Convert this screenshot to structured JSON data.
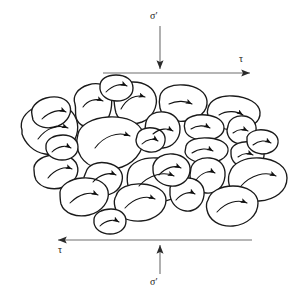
{
  "figure": {
    "background_color": "#ffffff",
    "stroke_color": "#1a1a1a",
    "arrow_line_color": "#6e6e6e",
    "width": 301,
    "height": 304
  },
  "labels": {
    "sigma_top": "σ′",
    "sigma_bottom": "σ′",
    "tau_top": "τ",
    "tau_bottom": "τ"
  },
  "chart_data": {
    "type": "diagram",
    "stress_indicators": [
      {
        "name": "normal-effective-stress-top",
        "symbol": "σ′",
        "direction": "down",
        "arrow": {
          "x1": 160,
          "y1": 26,
          "x2": 160,
          "y2": 68
        },
        "label_position": {
          "x": 150,
          "y": 11
        }
      },
      {
        "name": "shear-stress-top",
        "symbol": "τ",
        "direction": "right",
        "arrow": {
          "x1": 103,
          "y1": 73,
          "x2": 251,
          "y2": 73
        },
        "label_position": {
          "x": 239,
          "y": 54
        }
      },
      {
        "name": "shear-stress-bottom",
        "symbol": "τ",
        "direction": "left",
        "arrow": {
          "x1": 252,
          "y1": 240,
          "x2": 57,
          "y2": 240
        },
        "label_position": {
          "x": 58,
          "y": 245
        }
      },
      {
        "name": "normal-effective-stress-bottom",
        "symbol": "σ′",
        "direction": "up",
        "arrow": {
          "x1": 160,
          "y1": 274,
          "x2": 160,
          "y2": 245
        },
        "label_position": {
          "x": 150,
          "y": 277
        }
      }
    ],
    "particle_count": 27,
    "particles": [
      {
        "id": 1,
        "outline": "M 75,104 C 72,96 78,88 88,85 C 97,82 107,84 110,92 C 113,100 112,112 107,120 C 101,128 86,130 79,123 C 73,117 77,111 75,104 Z",
        "arrow": "M 83,107 C 88,100 96,98 103,101",
        "arrow_dir": "right"
      },
      {
        "id": 2,
        "outline": "M 114,96 C 114,87 122,82 133,82 C 145,82 154,88 156,97 C 158,107 152,118 142,122 C 131,126 119,122 116,113 C 114,106 114,101 114,96 Z",
        "arrow": "M 121,109 C 127,98 136,94 145,97",
        "arrow_dir": "right"
      },
      {
        "id": 3,
        "outline": "M 160,96 C 162,88 172,84 184,85 C 197,86 206,92 207,101 C 208,111 199,119 186,121 C 173,123 162,117 160,108 C 159,103 159,100 160,96 Z",
        "arrow": "M 169,104 C 177,100 186,101 192,104",
        "arrow_dir": "right"
      },
      {
        "id": 4,
        "outline": "M 208,108 C 210,100 220,95 233,96 C 248,97 259,103 260,112 C 261,122 250,130 235,130 C 221,130 210,124 208,116 C 207,113 207,111 208,108 Z",
        "arrow": "M 219,115 C 227,110 237,111 243,115",
        "arrow_dir": "right"
      },
      {
        "id": 5,
        "outline": "M 22,130 C 19,121 25,112 36,107 C 48,102 62,103 70,110 C 78,117 80,129 75,139 C 70,150 57,156 45,154 C 33,152 25,143 22,134 Z",
        "arrow": "M 38,139 C 46,128 58,124 68,128",
        "arrow_dir": "right"
      },
      {
        "id": 6,
        "outline": "M 78,134 C 80,125 92,118 108,117 C 126,116 140,122 143,133 C 146,146 138,161 122,167 C 106,173 88,168 81,157 C 76,149 76,141 78,134 Z",
        "arrow": "M 95,148 C 104,136 118,131 130,136",
        "arrow_dir": "right"
      },
      {
        "id": 7,
        "outline": "M 146,122 C 148,115 155,111 164,112 C 174,113 180,120 180,129 C 180,139 173,147 163,148 C 153,149 146,143 145,134 C 145,129 145,126 146,122 Z",
        "arrow": "M 153,134 C 160,128 168,128 173,131",
        "arrow_dir": "right"
      },
      {
        "id": 8,
        "outline": "M 185,122 C 187,117 196,114 206,115 C 217,116 224,121 224,128 C 224,135 216,140 205,140 C 194,140 186,136 185,130 C 184,127 184,125 185,122 Z",
        "arrow": "M 191,129 C 197,125 205,125 210,128",
        "arrow_dir": "right"
      },
      {
        "id": 9,
        "outline": "M 228,126 C 229,119 236,115 244,116 C 252,117 257,123 256,131 C 255,140 248,145 240,144 C 232,143 227,137 227,130 Z",
        "arrow": "M 233,133 C 238,129 244,129 248,131",
        "arrow_dir": "right"
      },
      {
        "id": 10,
        "outline": "M 186,146 C 188,140 197,137 209,138 C 221,139 229,144 228,151 C 227,158 218,163 206,163 C 194,163 186,158 185,152 Z",
        "arrow": "M 192,153 C 199,148 208,148 213,151",
        "arrow_dir": "right"
      },
      {
        "id": 11,
        "outline": "M 231,150 C 233,144 241,141 250,142 C 259,143 265,148 264,156 C 263,164 255,169 246,168 C 237,167 231,161 231,154 Z",
        "arrow": "M 238,157 C 243,153 249,153 253,155",
        "arrow_dir": "right"
      },
      {
        "id": 12,
        "outline": "M 34,170 C 33,163 40,157 51,155 C 63,153 74,157 77,165 C 80,173 75,183 64,187 C 53,191 41,188 36,180 C 34,176 34,173 34,170 Z",
        "arrow": "M 48,178 C 55,169 65,166 72,169",
        "arrow_dir": "left"
      },
      {
        "id": 13,
        "outline": "M 86,172 C 88,165 97,161 107,163 C 118,165 124,172 122,181 C 120,191 110,197 99,195 C 88,193 83,185 84,177 Z",
        "arrow": "M 93,182 C 100,174 110,172 116,175",
        "arrow_dir": "left"
      },
      {
        "id": 14,
        "outline": "M 128,172 C 130,163 142,157 157,158 C 173,159 185,167 186,178 C 187,190 176,200 160,202 C 144,204 131,197 128,186 C 127,181 127,176 128,172 Z",
        "arrow": "M 139,186 C 149,175 163,171 174,176",
        "arrow_dir": "left"
      },
      {
        "id": 15,
        "outline": "M 191,168 C 193,161 201,157 210,158 C 220,159 226,166 225,176 C 224,187 216,194 206,193 C 196,192 190,184 190,175 Z",
        "arrow": "M 196,180 C 202,172 210,170 215,173",
        "arrow_dir": "down"
      },
      {
        "id": 16,
        "outline": "M 230,172 C 233,163 245,157 260,158 C 276,159 287,167 287,178 C 287,191 275,200 259,201 C 243,202 231,195 229,184 C 228,179 228,176 230,172 Z",
        "arrow": "M 241,186 C 251,175 265,171 276,176",
        "arrow_dir": "left"
      },
      {
        "id": 17,
        "outline": "M 60,192 C 61,185 70,179 82,178 C 95,177 106,182 108,191 C 110,201 102,212 89,215 C 76,218 64,213 61,204 C 60,200 60,196 60,192 Z",
        "arrow": "M 70,203 C 79,194 90,191 98,195",
        "arrow_dir": "left"
      },
      {
        "id": 18,
        "outline": "M 116,196 C 118,188 129,183 142,184 C 156,185 166,191 166,200 C 166,211 155,220 141,221 C 127,222 117,216 115,207 C 114,203 114,199 116,196 Z",
        "arrow": "M 125,208 C 134,198 146,195 155,199",
        "arrow_dir": "left"
      },
      {
        "id": 19,
        "outline": "M 170,188 C 172,181 180,177 189,178 C 199,179 205,186 204,195 C 203,205 195,212 186,211 C 177,210 171,203 170,195 Z",
        "arrow": "M 176,200 C 182,193 190,191 195,194",
        "arrow_dir": "left"
      },
      {
        "id": 20,
        "outline": "M 208,200 C 210,192 220,186 233,186 C 247,186 258,193 258,203 C 258,215 247,225 233,226 C 219,227 209,220 207,210 C 206,206 206,203 208,200 Z",
        "arrow": "M 217,212 C 226,202 238,199 247,203",
        "arrow_dir": "left"
      },
      {
        "id": 21,
        "outline": "M 32,115 C 30,108 36,101 46,98 C 57,95 67,98 70,106 C 72,113 68,122 58,126 C 47,130 37,127 33,120 Z",
        "arrow": "M 42,119 C 50,111 60,109 66,112",
        "arrow_dir": "right"
      },
      {
        "id": 22,
        "outline": "M 100,86 C 100,79 107,75 116,75 C 126,75 133,80 133,88 C 133,96 126,101 117,101 C 108,101 101,96 100,89 Z",
        "arrow": "M 106,92 C 113,85 121,83 127,86",
        "arrow_dir": "right"
      },
      {
        "id": 23,
        "outline": "M 153,166 C 155,158 163,153 173,154 C 184,155 191,162 190,171 C 189,181 180,187 170,186 C 160,185 153,178 153,170 Z",
        "arrow": "M 159,175 C 166,167 175,165 181,168",
        "arrow_dir": "left"
      },
      {
        "id": 24,
        "outline": "M 247,137 C 249,132 256,129 264,130 C 273,131 279,136 278,143 C 277,150 270,154 262,154 C 253,153 247,148 247,141 Z",
        "arrow": "M 253,145 C 259,140 266,140 271,143",
        "arrow_dir": "right"
      },
      {
        "id": 25,
        "outline": "M 46,145 C 47,139 54,135 63,135 C 72,135 78,140 78,147 C 78,155 71,160 62,160 C 53,160 47,155 46,149 Z",
        "arrow": "M 52,152 C 58,146 66,145 71,148",
        "arrow_dir": "right"
      },
      {
        "id": 26,
        "outline": "M 137,136 C 138,130 145,127 153,128 C 161,129 166,134 165,141 C 164,149 157,153 149,152 C 141,151 136,146 136,140 Z",
        "arrow": "M 142,144 C 147,139 154,138 158,141",
        "arrow_dir": "right"
      },
      {
        "id": 27,
        "outline": "M 94,219 C 95,213 102,209 111,209 C 120,209 126,214 126,221 C 126,229 119,234 110,234 C 101,234 95,229 94,223 Z",
        "arrow": "M 100,226 C 106,220 114,219 119,222",
        "arrow_dir": "left"
      }
    ]
  }
}
